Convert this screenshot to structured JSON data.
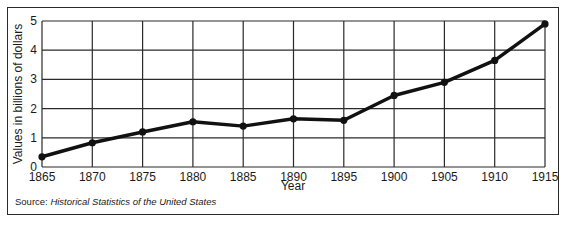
{
  "chart_data": {
    "type": "line",
    "title": "",
    "xlabel": "Year",
    "ylabel": "Values in billions of dollars",
    "x": [
      1865,
      1870,
      1875,
      1880,
      1885,
      1890,
      1895,
      1900,
      1905,
      1910,
      1915
    ],
    "series": [
      {
        "name": "Value",
        "values": [
          0.35,
          0.83,
          1.2,
          1.55,
          1.4,
          1.65,
          1.6,
          2.45,
          2.9,
          3.65,
          4.9
        ]
      }
    ],
    "xlim": [
      1865,
      1915
    ],
    "ylim": [
      0,
      5
    ],
    "x_ticks": [
      "1865",
      "1870",
      "1875",
      "1880",
      "1885",
      "1890",
      "1895",
      "1900",
      "1905",
      "1910",
      "1915"
    ],
    "y_ticks": [
      "0",
      "1",
      "2",
      "3",
      "4",
      "5"
    ],
    "grid": true,
    "legend": null,
    "line_color": "#111111"
  },
  "source": {
    "prefix": "Source: ",
    "title": "Historical Statistics of the United States"
  }
}
